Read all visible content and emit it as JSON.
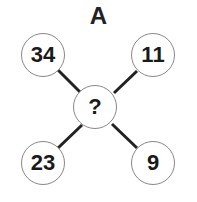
{
  "title": "A",
  "nodes": {
    "top_left": "34",
    "top_right": "11",
    "center": "?",
    "bottom_left": "23",
    "bottom_right": "9"
  }
}
